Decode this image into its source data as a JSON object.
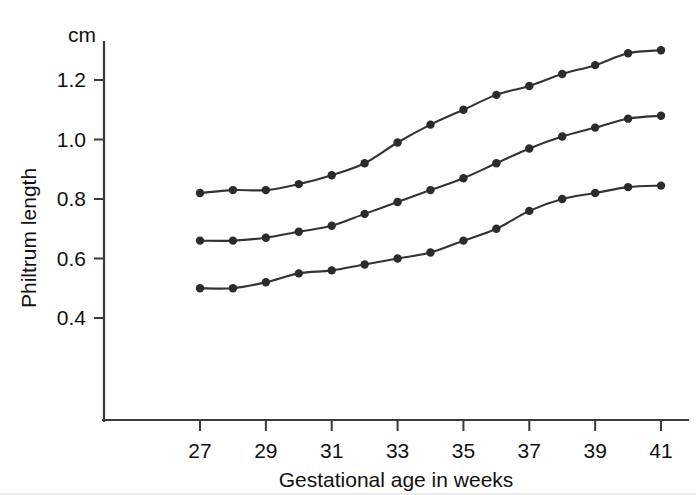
{
  "chart_data": {
    "type": "line",
    "title": "",
    "xlabel": "Gestational age in weeks",
    "ylabel": "Philtrum length",
    "yunit": "cm",
    "x": [
      27,
      28,
      29,
      30,
      31,
      32,
      33,
      34,
      35,
      36,
      37,
      38,
      39,
      40,
      41
    ],
    "xtick_labels": [
      "27",
      "29",
      "31",
      "33",
      "35",
      "37",
      "39",
      "41"
    ],
    "xticks": [
      27,
      29,
      31,
      33,
      35,
      37,
      39,
      41
    ],
    "ytick_labels": [
      "0.4",
      "0.6",
      "0.8",
      "1.0",
      "1.2"
    ],
    "yticks": [
      0.4,
      0.6,
      0.8,
      1.0,
      1.2
    ],
    "xlim": [
      25.7,
      41.9
    ],
    "ylim": [
      0.27,
      1.38
    ],
    "grid": false,
    "legend": "none",
    "markers": "filled-circle",
    "series": [
      {
        "name": "upper-centile",
        "values": [
          0.82,
          0.83,
          0.83,
          0.85,
          0.88,
          0.92,
          0.99,
          1.05,
          1.1,
          1.15,
          1.18,
          1.22,
          1.25,
          1.29,
          1.3
        ]
      },
      {
        "name": "median-centile",
        "values": [
          0.66,
          0.66,
          0.67,
          0.69,
          0.71,
          0.75,
          0.79,
          0.83,
          0.87,
          0.92,
          0.97,
          1.01,
          1.04,
          1.07,
          1.08
        ]
      },
      {
        "name": "lower-centile",
        "values": [
          0.5,
          0.5,
          0.52,
          0.55,
          0.56,
          0.58,
          0.6,
          0.62,
          0.66,
          0.7,
          0.76,
          0.8,
          0.82,
          0.84,
          0.845
        ]
      }
    ]
  },
  "axes": {
    "y_unit_label": "cm",
    "y_axis_title": "Philtrum length",
    "x_axis_title": "Gestational age in weeks"
  },
  "colors": {
    "curve": "#333333",
    "marker": "#2b2b2b",
    "axis": "#3a3a3a",
    "text": "#111111",
    "background": "#ffffff"
  }
}
